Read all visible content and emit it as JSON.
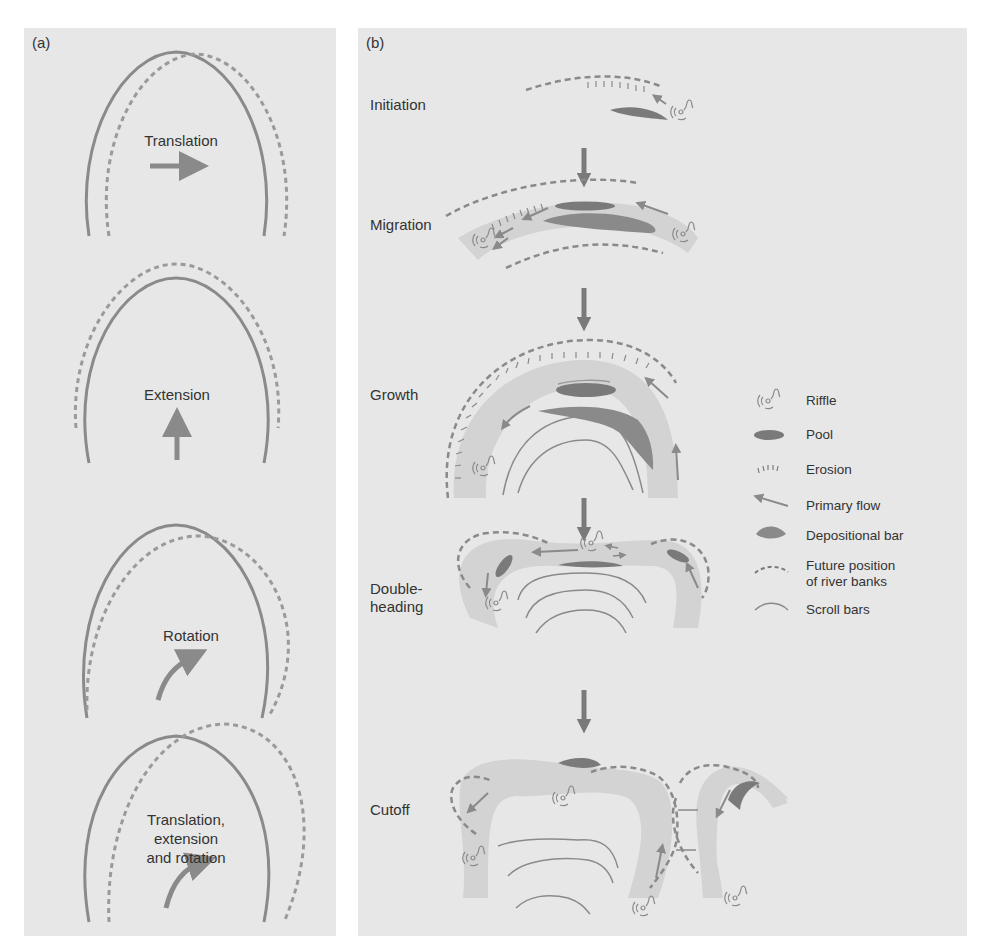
{
  "panel_a": {
    "label": "(a)",
    "diagrams": [
      {
        "caption": "Translation"
      },
      {
        "caption": "Extension"
      },
      {
        "caption": "Rotation"
      },
      {
        "caption_lines": [
          "Translation,",
          "extension",
          "and rotation"
        ]
      }
    ]
  },
  "panel_b": {
    "label": "(b)",
    "stages": [
      {
        "label": "Initiation"
      },
      {
        "label": "Migration"
      },
      {
        "label": "Growth"
      },
      {
        "label_lines": [
          "Double-",
          "heading"
        ]
      },
      {
        "label": "Cutoff"
      }
    ],
    "legend": [
      {
        "icon": "riffle-icon",
        "label": "Riffle"
      },
      {
        "icon": "pool-icon",
        "label": "Pool"
      },
      {
        "icon": "erosion-icon",
        "label": "Erosion"
      },
      {
        "icon": "primary-flow-icon",
        "label": "Primary flow"
      },
      {
        "icon": "depositional-bar-icon",
        "label": "Depositional bar"
      },
      {
        "icon": "future-bank-icon",
        "label_lines": [
          "Future position",
          "of river banks"
        ]
      },
      {
        "icon": "scroll-bar-icon",
        "label": "Scroll bars"
      }
    ]
  },
  "colors": {
    "panel_bg": "#e7e7e7",
    "line": "#8a8a8a",
    "dark": "#7a7a7a",
    "channel": "#d3d3d3"
  }
}
